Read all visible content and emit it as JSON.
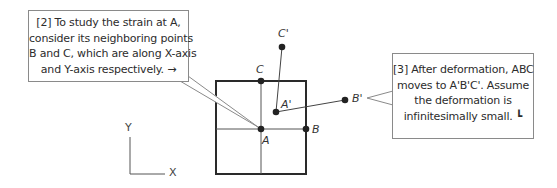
{
  "callouts": [
    {
      "id": "step-2",
      "lines": [
        "[2] To study the strain at A,",
        "consider its neighboring points",
        "B and C, which are along X-axis",
        "and Y-axis respectively. →"
      ]
    },
    {
      "id": "step-3",
      "lines": [
        "[3] After deformation, ABC",
        "moves to A'B'C'. Assume",
        "the deformation is",
        "infinitesimally small.  ┗"
      ]
    }
  ],
  "points": {
    "A": "A",
    "B": "B",
    "C": "C",
    "A_prime": "A'",
    "B_prime": "B'",
    "C_prime": "C'"
  },
  "axes": {
    "x_label": "X",
    "y_label": "Y"
  },
  "colors": {
    "line": "#333333",
    "callout_border": "#8a8a8a",
    "box_border": "#2a2a2a"
  }
}
